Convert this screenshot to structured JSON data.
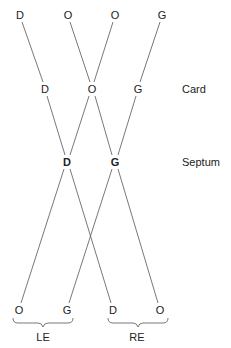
{
  "diagram": {
    "top_row": [
      "D",
      "O",
      "O",
      "G"
    ],
    "card_row": [
      "D",
      "O",
      "G"
    ],
    "septum_row": [
      "D",
      "G"
    ],
    "bottom_row": [
      "O",
      "G",
      "D",
      "O"
    ],
    "row_labels": {
      "card": "Card",
      "septum": "Septum"
    },
    "eye_labels": {
      "left": "LE",
      "right": "RE"
    },
    "line_color": "#555555"
  }
}
